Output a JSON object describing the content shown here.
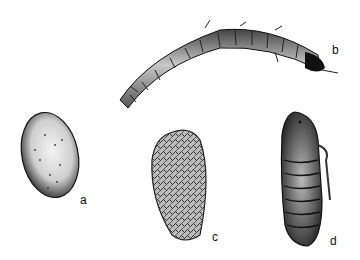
{
  "figure": {
    "panels": [
      {
        "id": "a",
        "label": "a",
        "subject": "egg"
      },
      {
        "id": "b",
        "label": "b",
        "subject": "larva"
      },
      {
        "id": "c",
        "label": "c",
        "subject": "cocoon"
      },
      {
        "id": "d",
        "label": "d",
        "subject": "pupa"
      }
    ]
  }
}
